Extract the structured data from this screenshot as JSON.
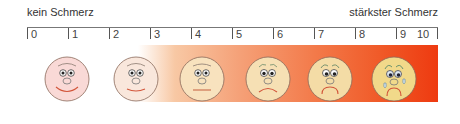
{
  "labels": {
    "left": "kein Schmerz",
    "right": "stärkster Schmerz"
  },
  "scale": {
    "ticks": [
      "0",
      "1",
      "2",
      "3",
      "4",
      "5",
      "6",
      "7",
      "8",
      "9",
      "10"
    ]
  },
  "colors": {
    "gradient_start": "#ffffff",
    "gradient_end": "#ee3a10",
    "face_outline": "#8a6a5a",
    "mouth": "#d2553a"
  },
  "faces": [
    {
      "name": "face-no-pain",
      "fill": "#f9d9d6",
      "expression": "big smile"
    },
    {
      "name": "face-mild-pain",
      "fill": "#f9e7dc",
      "expression": "small smile"
    },
    {
      "name": "face-moderate-pain",
      "fill": "#f8e2be",
      "expression": "neutral"
    },
    {
      "name": "face-strong-pain",
      "fill": "#f6e0b4",
      "expression": "slight frown"
    },
    {
      "name": "face-severe-pain",
      "fill": "#f4dca6",
      "expression": "frown, worried"
    },
    {
      "name": "face-worst-pain",
      "fill": "#f1d98a",
      "expression": "crying"
    }
  ]
}
